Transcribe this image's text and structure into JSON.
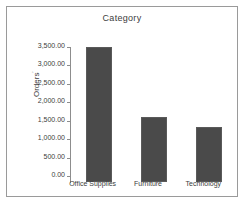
{
  "chart_data": {
    "type": "bar",
    "title": "Category",
    "xlabel": "",
    "ylabel": "Orders",
    "ylabel_suffix": " ",
    "categories": [
      "Office Supplies",
      "Furniture",
      "Technology"
    ],
    "values": [
      3660,
      1760,
      1490
    ],
    "ylim": [
      0,
      3500
    ],
    "ytick_values": [
      0,
      500,
      1000,
      1500,
      2000,
      2500,
      3000,
      3500
    ],
    "ytick_labels": [
      "0.00",
      "500.00",
      "1,000.00",
      "1,500.00",
      "2,000.00",
      "2,500.00",
      "3,000.00",
      "3,500.00"
    ],
    "grid": false,
    "legend": false,
    "bar_color": "#4a4a4a",
    "axis_color": "#8d8d8d",
    "frame_color": "#9a9a9a",
    "background": "#ffffff"
  }
}
